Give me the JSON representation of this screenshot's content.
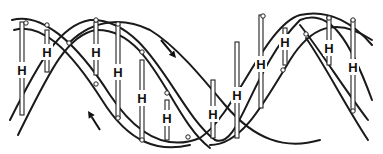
{
  "diagram": {
    "colors": {
      "line": "#1a1a1a",
      "background": "#ffffff"
    },
    "bond_label": "H",
    "strands": [
      {
        "name": "strand-a-outer",
        "d": "M 10 120 C 40 60, 60 25, 90 20 C 150 18, 175 110, 215 140 C 240 150, 250 70, 300 20 C 330 8, 350 40, 372 100"
      },
      {
        "name": "strand-a-inner",
        "d": "M 18 135 C 48 75, 66 35, 96 30 C 152 28, 170 118, 210 148"
      },
      {
        "name": "strand-b-outer",
        "d": "M 12 20 C 40 12, 75 40, 110 95 C 140 140, 170 150, 200 138 C 235 115, 265 25, 300 15 C 330 8, 355 25, 372 45"
      },
      {
        "name": "strand-b-inner",
        "d": "M 14 30 C 42 22, 70 50, 102 100 C 130 145, 160 152, 190 145"
      },
      {
        "name": "strand-c-outer",
        "d": "M 70 42 C 95 18, 125 18, 150 30 C 175 45, 200 75, 225 105 C 255 140, 285 150, 320 140"
      },
      {
        "name": "strand-c-inner",
        "d": "M 210 145 C 240 145, 260 110, 290 60 C 310 28, 335 15, 372 40"
      },
      {
        "name": "strand-d-outer",
        "d": "M 300 25 C 320 50, 345 90, 368 120"
      },
      {
        "name": "strand-d-inner",
        "d": "M 306 38 C 325 65, 345 105, 368 140"
      }
    ],
    "base_pairs": [
      {
        "id": "bp-1",
        "x": 22,
        "y1": 22,
        "y2": 115,
        "hy": 70
      },
      {
        "id": "bp-2",
        "x": 47,
        "y1": 30,
        "y2": 72,
        "hy": 52
      },
      {
        "id": "bp-3",
        "x": 96,
        "y1": 22,
        "y2": 75,
        "hy": 52
      },
      {
        "id": "bp-4",
        "x": 118,
        "y1": 25,
        "y2": 118,
        "hy": 72
      },
      {
        "id": "bp-5",
        "x": 142,
        "y1": 60,
        "y2": 140,
        "hy": 98
      },
      {
        "id": "bp-6",
        "x": 167,
        "y1": 100,
        "y2": 140,
        "hy": 118
      },
      {
        "id": "bp-7",
        "x": 213,
        "y1": 80,
        "y2": 138,
        "hy": 114
      },
      {
        "id": "bp-8",
        "x": 237,
        "y1": 42,
        "y2": 138,
        "hy": 95
      },
      {
        "id": "bp-9",
        "x": 261,
        "y1": 15,
        "y2": 108,
        "hy": 64
      },
      {
        "id": "bp-10",
        "x": 285,
        "y1": 28,
        "y2": 65,
        "hy": 42
      },
      {
        "id": "bp-11",
        "x": 329,
        "y1": 16,
        "y2": 65,
        "hy": 48
      },
      {
        "id": "bp-12",
        "x": 353,
        "y1": 20,
        "y2": 110,
        "hy": 67
      }
    ],
    "nodes": [
      {
        "x": 26,
        "y": 23
      },
      {
        "x": 47,
        "y": 25
      },
      {
        "x": 69,
        "y": 43
      },
      {
        "x": 96,
        "y": 20
      },
      {
        "x": 118,
        "y": 24
      },
      {
        "x": 96,
        "y": 84
      },
      {
        "x": 118,
        "y": 118
      },
      {
        "x": 142,
        "y": 52
      },
      {
        "x": 167,
        "y": 93
      },
      {
        "x": 142,
        "y": 140
      },
      {
        "x": 188,
        "y": 137
      },
      {
        "x": 263,
        "y": 16
      },
      {
        "x": 306,
        "y": 34
      },
      {
        "x": 283,
        "y": 70
      },
      {
        "x": 353,
        "y": 20
      },
      {
        "x": 353,
        "y": 111
      },
      {
        "x": 329,
        "y": 18
      }
    ],
    "arrows": [
      {
        "name": "direction-arrow-down",
        "x1": 161,
        "y1": 40,
        "x2": 176,
        "y2": 58,
        "label": "5' to 3'"
      },
      {
        "name": "direction-arrow-up",
        "x1": 100,
        "y1": 130,
        "x2": 88,
        "y2": 111,
        "label": "3' to 5'"
      }
    ]
  }
}
